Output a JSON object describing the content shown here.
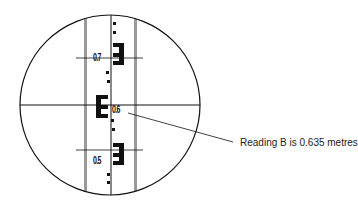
{
  "diagram": {
    "staff_labels": [
      {
        "text": "0.7",
        "y": 52
      },
      {
        "text": "0.6",
        "y": 106
      },
      {
        "text": "0.5",
        "y": 156
      }
    ],
    "annotation": "Reading B is 0.635 metres",
    "colors": {
      "line": "#111111",
      "staff_edge": "#999999",
      "background": "#ffffff"
    }
  }
}
